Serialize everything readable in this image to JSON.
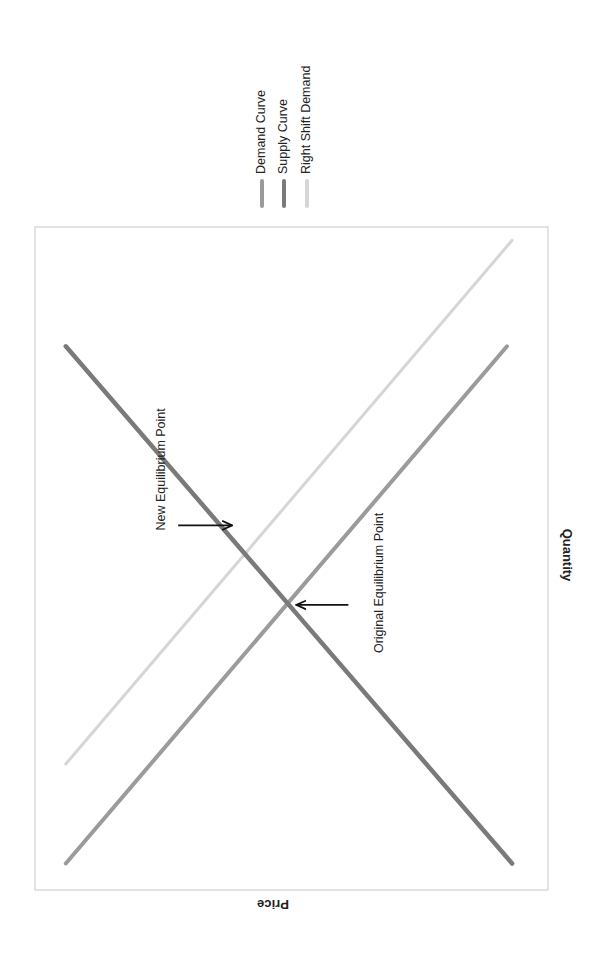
{
  "chart_data": {
    "type": "line",
    "title": "",
    "xlabel": "Quantity",
    "ylabel": "Price",
    "orientation": "rotated 90° counter-clockwise",
    "xlim": [
      0,
      10
    ],
    "ylim": [
      0,
      10
    ],
    "grid": false,
    "axis_ticks": false,
    "legend": {
      "placement": "top-right (outside plot, rotated)",
      "entries": [
        "Demand Curve",
        "Supply Curve",
        "Right Shift Demand"
      ]
    },
    "series": [
      {
        "name": "Demand Curve",
        "color": "#9b9b9b",
        "x": [
          0.4,
          8.2
        ],
        "y": [
          9.4,
          0.8
        ]
      },
      {
        "name": "Supply Curve",
        "color": "#7a7a7a",
        "x": [
          0.4,
          8.2
        ],
        "y": [
          0.7,
          9.4
        ]
      },
      {
        "name": "Right Shift Demand",
        "color": "#d6d6d6",
        "x": [
          1.9,
          9.8
        ],
        "y": [
          9.4,
          0.7
        ]
      }
    ],
    "annotations": [
      {
        "text": "Original Equilibrium Point",
        "point": {
          "x": 4.3,
          "y": 5.1
        },
        "arrow": true,
        "side": "below-right"
      },
      {
        "text": "New Equilibrium Point",
        "point": {
          "x": 5.5,
          "y": 6.0
        },
        "arrow": true,
        "side": "above-left"
      }
    ]
  }
}
